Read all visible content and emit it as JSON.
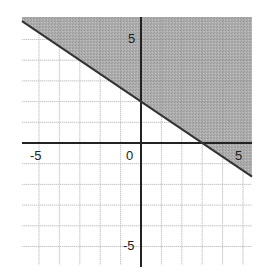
{
  "chart_data": {
    "type": "line",
    "title": "",
    "xlabel": "",
    "ylabel": "",
    "xlim": [
      -5.8,
      5.5
    ],
    "ylim": [
      -6,
      5.8
    ],
    "grid": true,
    "grid_step": 1,
    "x_tick_labels": [
      "-5",
      "0",
      "5"
    ],
    "y_tick_labels": [
      "5",
      "-5"
    ],
    "series": [
      {
        "name": "boundary",
        "equation": "y = -2/3 x + 2",
        "slope": -0.6667,
        "intercept": 2,
        "x": [
          -5.8,
          0,
          3,
          5.5
        ],
        "y": [
          5.87,
          2,
          0,
          -1.67
        ],
        "line_style": "solid"
      }
    ],
    "shaded_region": {
      "side": "above",
      "inequality": "y >= -2/3 x + 2",
      "color": "#a8a8a8"
    },
    "colors": {
      "axis": "#222222",
      "grid": "#d8d8d8",
      "shade": "#a8a8a8",
      "boundary": "#333333"
    }
  },
  "labels": {
    "x_neg5": "-5",
    "x_zero": "0",
    "x_pos5": "5",
    "y_pos5": "5",
    "y_neg5": "-5"
  }
}
